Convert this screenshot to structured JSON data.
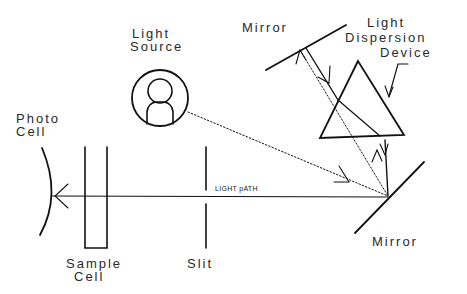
{
  "diagram": {
    "labels": {
      "light_source_line1": "Light",
      "light_source_line2": "Source",
      "photo_cell_line1": "Photo",
      "photo_cell_line2": "Cell",
      "top_mirror": "Mirror",
      "dispersion_line1": "Light",
      "dispersion_line2": "Dispersion",
      "dispersion_line3": "Device",
      "light_path": "LIGHT pATH",
      "sample_cell_line1": "Sample",
      "sample_cell_line2": "Cell",
      "slit": "Slit",
      "bottom_mirror": "Mirror"
    },
    "components": [
      {
        "name": "Light Source",
        "shape": "circle-with-bulb"
      },
      {
        "name": "Mirror (top)",
        "shape": "line"
      },
      {
        "name": "Light Dispersion Device",
        "shape": "triangle-prism"
      },
      {
        "name": "Mirror (bottom)",
        "shape": "line"
      },
      {
        "name": "Slit",
        "shape": "split-line"
      },
      {
        "name": "Sample Cell",
        "shape": "u-cuvette"
      },
      {
        "name": "Photo Cell",
        "shape": "arc"
      }
    ],
    "colors": {
      "stroke": "#111111",
      "text": "#2a2a2a",
      "background": "#ffffff"
    }
  }
}
